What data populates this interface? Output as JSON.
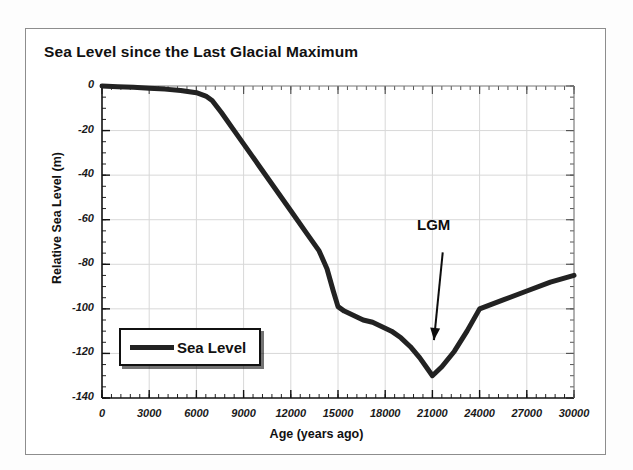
{
  "figure": {
    "title": "Sea Level since the Last Glacial Maximum",
    "frame_color": "#8d8d8d",
    "background": "#ffffff"
  },
  "annotations": [
    {
      "name": "lgm",
      "text": "LGM"
    }
  ],
  "legend": {
    "position": "inside-lower-left",
    "entries": [
      {
        "label": "Sea Level",
        "color": "#222222"
      }
    ]
  },
  "chart_data": {
    "type": "line",
    "title": "Sea Level since the Last Glacial Maximum",
    "xlabel": "Age (years ago)",
    "ylabel": "Relative Sea Level (m)",
    "xlim": [
      0,
      30000
    ],
    "ylim": [
      -140,
      0
    ],
    "xticks": [
      0,
      3000,
      6000,
      9000,
      12000,
      15000,
      18000,
      21000,
      24000,
      27000,
      30000
    ],
    "xtick_labels": [
      "0",
      "3000",
      "6000",
      "9000",
      "12000",
      "15000",
      "18000",
      "21000",
      "24000",
      "27000",
      "30000"
    ],
    "yticks": [
      0,
      -20,
      -40,
      -60,
      -80,
      -100,
      -120,
      -140
    ],
    "ytick_labels": [
      "0",
      "-20",
      "-40",
      "-60",
      "-80",
      "-100",
      "-120",
      "-140"
    ],
    "x_minor_tick_interval": 600,
    "y_minor_tick_interval": 5,
    "grid": true,
    "grid_color": "#d8d8d8",
    "line_color": "#222222",
    "line_width_px": 5,
    "legend_position": "lower left",
    "annotations": [
      {
        "text": "LGM",
        "x": 22800,
        "y": -72,
        "arrow_to_x": 21100,
        "arrow_to_y": -114
      }
    ],
    "series": [
      {
        "name": "Sea Level",
        "color": "#222222",
        "x": [
          0,
          1000,
          2000,
          3000,
          4000,
          5000,
          6000,
          6600,
          7000,
          7600,
          8400,
          9200,
          10000,
          11000,
          12000,
          13000,
          13800,
          14300,
          14700,
          15000,
          15400,
          16000,
          16600,
          17200,
          17800,
          18400,
          19000,
          19600,
          20200,
          20700,
          21000,
          21600,
          22400,
          23200,
          24000,
          25500,
          27000,
          28500,
          30000
        ],
        "y": [
          0,
          -0.3,
          -0.6,
          -1.0,
          -1.4,
          -2.0,
          -3.0,
          -4.5,
          -6.5,
          -12,
          -20,
          -28,
          -36,
          -46,
          -56,
          -66,
          -74,
          -82,
          -92,
          -99,
          -101,
          -103,
          -105,
          -106,
          -108,
          -110,
          -113,
          -117,
          -122,
          -127,
          -130,
          -126,
          -119,
          -110,
          -100,
          -96,
          -92,
          -88,
          -85
        ]
      }
    ]
  }
}
